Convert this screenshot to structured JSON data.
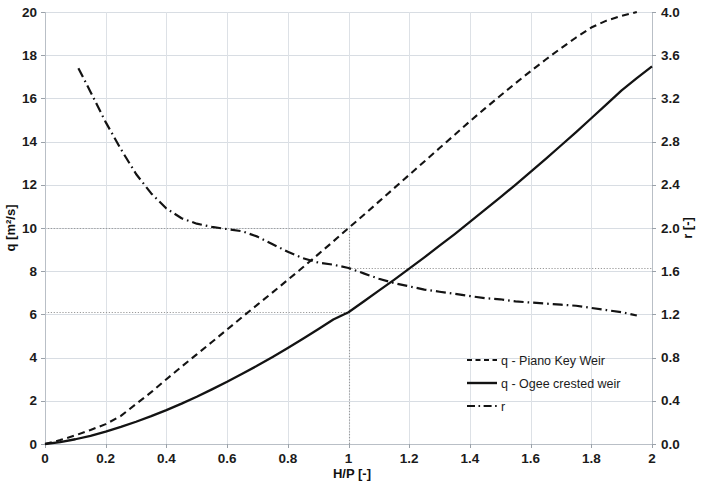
{
  "chart_data": {
    "type": "line",
    "title": "",
    "subtitle": "",
    "xlabel": "H/P [-]",
    "ylabel": "q [m²/s]",
    "y2label": "r [-]",
    "xlim": [
      0,
      2
    ],
    "ylim": [
      0,
      20
    ],
    "y2lim": [
      0,
      4
    ],
    "grid": true,
    "legend_position": "center-right",
    "xticks": [
      "0",
      "0.2",
      "0.4",
      "0.6",
      "0.8",
      "1",
      "1.2",
      "1.4",
      "1.6",
      "1.8",
      "2"
    ],
    "xtick_values": [
      0,
      0.2,
      0.4,
      0.6,
      0.8,
      1,
      1.2,
      1.4,
      1.6,
      1.8,
      2
    ],
    "yticks": [
      "0",
      "2",
      "4",
      "6",
      "8",
      "10",
      "12",
      "14",
      "16",
      "18",
      "20"
    ],
    "ytick_values": [
      0,
      2,
      4,
      6,
      8,
      10,
      12,
      14,
      16,
      18,
      20
    ],
    "y2ticks": [
      "0.0",
      "0.4",
      "0.8",
      "1.2",
      "1.6",
      "2.0",
      "2.4",
      "2.8",
      "3.2",
      "3.6",
      "4.0"
    ],
    "y2tick_values": [
      0.0,
      0.4,
      0.8,
      1.2,
      1.6,
      2.0,
      2.4,
      2.8,
      3.2,
      3.6,
      4.0
    ],
    "series": [
      {
        "name": "q - Piano Key Weir",
        "axis": "left",
        "style": "dashed",
        "color": "#131313",
        "x": [
          0.0,
          0.05,
          0.1,
          0.15,
          0.2,
          0.25,
          0.3,
          0.35,
          0.4,
          0.45,
          0.5,
          0.55,
          0.6,
          0.65,
          0.7,
          0.75,
          0.8,
          0.85,
          0.9,
          0.95,
          1.0,
          1.05,
          1.1,
          1.15,
          1.2,
          1.25,
          1.3,
          1.35,
          1.4,
          1.45,
          1.5,
          1.55,
          1.6,
          1.65,
          1.7,
          1.75,
          1.8,
          1.85,
          1.9,
          1.95
        ],
        "y": [
          0.0,
          0.18,
          0.4,
          0.65,
          0.92,
          1.3,
          1.85,
          2.4,
          3.0,
          3.58,
          4.15,
          4.72,
          5.3,
          5.88,
          6.45,
          7.02,
          7.6,
          8.18,
          8.78,
          9.38,
          10.0,
          10.6,
          11.22,
          11.84,
          12.46,
          13.08,
          13.7,
          14.32,
          14.94,
          15.54,
          16.12,
          16.7,
          17.26,
          17.8,
          18.32,
          18.82,
          19.28,
          19.6,
          19.82,
          20.0
        ]
      },
      {
        "name": "q - Ogee crested weir",
        "axis": "left",
        "style": "solid",
        "color": "#131313",
        "x": [
          0.0,
          0.05,
          0.1,
          0.15,
          0.2,
          0.25,
          0.3,
          0.35,
          0.4,
          0.45,
          0.5,
          0.55,
          0.6,
          0.65,
          0.7,
          0.75,
          0.8,
          0.85,
          0.9,
          0.95,
          1.0,
          1.05,
          1.1,
          1.15,
          1.2,
          1.25,
          1.3,
          1.35,
          1.4,
          1.45,
          1.5,
          1.55,
          1.6,
          1.65,
          1.7,
          1.75,
          1.8,
          1.85,
          1.9,
          1.95,
          2.0
        ],
        "y": [
          0.0,
          0.09,
          0.22,
          0.38,
          0.57,
          0.79,
          1.03,
          1.29,
          1.57,
          1.87,
          2.19,
          2.53,
          2.88,
          3.25,
          3.63,
          4.03,
          4.44,
          4.87,
          5.31,
          5.76,
          6.1,
          6.6,
          7.1,
          7.6,
          8.12,
          8.64,
          9.18,
          9.72,
          10.28,
          10.85,
          11.42,
          12.0,
          12.6,
          13.2,
          13.82,
          14.44,
          15.08,
          15.72,
          16.37,
          16.94,
          17.48
        ]
      },
      {
        "name": "r",
        "axis": "right",
        "style": "dash-dot",
        "color": "#131313",
        "x": [
          0.11,
          0.15,
          0.2,
          0.25,
          0.3,
          0.35,
          0.4,
          0.45,
          0.5,
          0.55,
          0.6,
          0.65,
          0.7,
          0.75,
          0.8,
          0.85,
          0.9,
          0.95,
          1.0,
          1.05,
          1.1,
          1.15,
          1.2,
          1.25,
          1.3,
          1.35,
          1.4,
          1.45,
          1.5,
          1.55,
          1.6,
          1.65,
          1.7,
          1.75,
          1.8,
          1.85,
          1.9,
          1.95
        ],
        "y": [
          3.48,
          3.26,
          2.98,
          2.73,
          2.5,
          2.32,
          2.18,
          2.09,
          2.04,
          2.01,
          1.99,
          1.97,
          1.92,
          1.85,
          1.78,
          1.72,
          1.68,
          1.66,
          1.63,
          1.58,
          1.53,
          1.49,
          1.46,
          1.43,
          1.41,
          1.39,
          1.37,
          1.35,
          1.34,
          1.32,
          1.31,
          1.3,
          1.29,
          1.28,
          1.26,
          1.24,
          1.22,
          1.19
        ]
      }
    ],
    "reference_lines": [
      {
        "name": "q-pkw-at-hp-1",
        "orientation": "horizontal",
        "axis": "left",
        "value": 10.0,
        "x_from": 0.0,
        "x_to": 1.0
      },
      {
        "name": "r-at-hp-1",
        "orientation": "horizontal",
        "axis": "right",
        "value": 1.63,
        "x_from": 1.0,
        "x_to": 2.0
      },
      {
        "name": "q-ogee-at-hp-1",
        "orientation": "horizontal",
        "axis": "left",
        "value": 6.1,
        "x_from": 0.0,
        "x_to": 1.0
      },
      {
        "name": "hp-equals-1",
        "orientation": "vertical",
        "axis": "x",
        "value": 1.0,
        "y_from": 0.0,
        "y_to": 10.0
      }
    ],
    "annotations": []
  },
  "legend": {
    "items": [
      {
        "label": "q - Piano Key Weir",
        "style": "dashed"
      },
      {
        "label": "q - Ogee crested weir",
        "style": "solid"
      },
      {
        "label": "r",
        "style": "dash-dot"
      }
    ]
  },
  "colors": {
    "ink": "#131313",
    "grid": "#d8dde3",
    "axis": "#b9bfc6",
    "reference": "#9a9a9a",
    "background": "#ffffff"
  }
}
